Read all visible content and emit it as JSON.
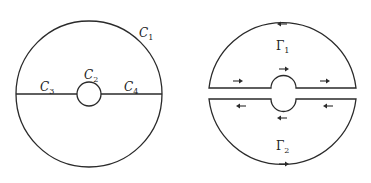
{
  "figure": {
    "left": {
      "description": "Disk with outer circle C1, small inner circle C2, and horizontal cuts C3 and C4",
      "labels": {
        "c1": {
          "base": "C",
          "sub": "1"
        },
        "c2": {
          "base": "C",
          "sub": "2"
        },
        "c3": {
          "base": "C",
          "sub": "3"
        },
        "c4": {
          "base": "C",
          "sub": "4"
        }
      }
    },
    "right": {
      "description": "Disk split into upper contour Γ1 and lower contour Γ2 with orientation arrows",
      "labels": {
        "g1": {
          "base": "Γ",
          "sub": "1"
        },
        "g2": {
          "base": "Γ",
          "sub": "2"
        }
      },
      "arrows": {
        "upper": [
          "left",
          "right",
          "right",
          "right"
        ],
        "lower": [
          "left",
          "left",
          "left",
          "right"
        ]
      }
    }
  }
}
